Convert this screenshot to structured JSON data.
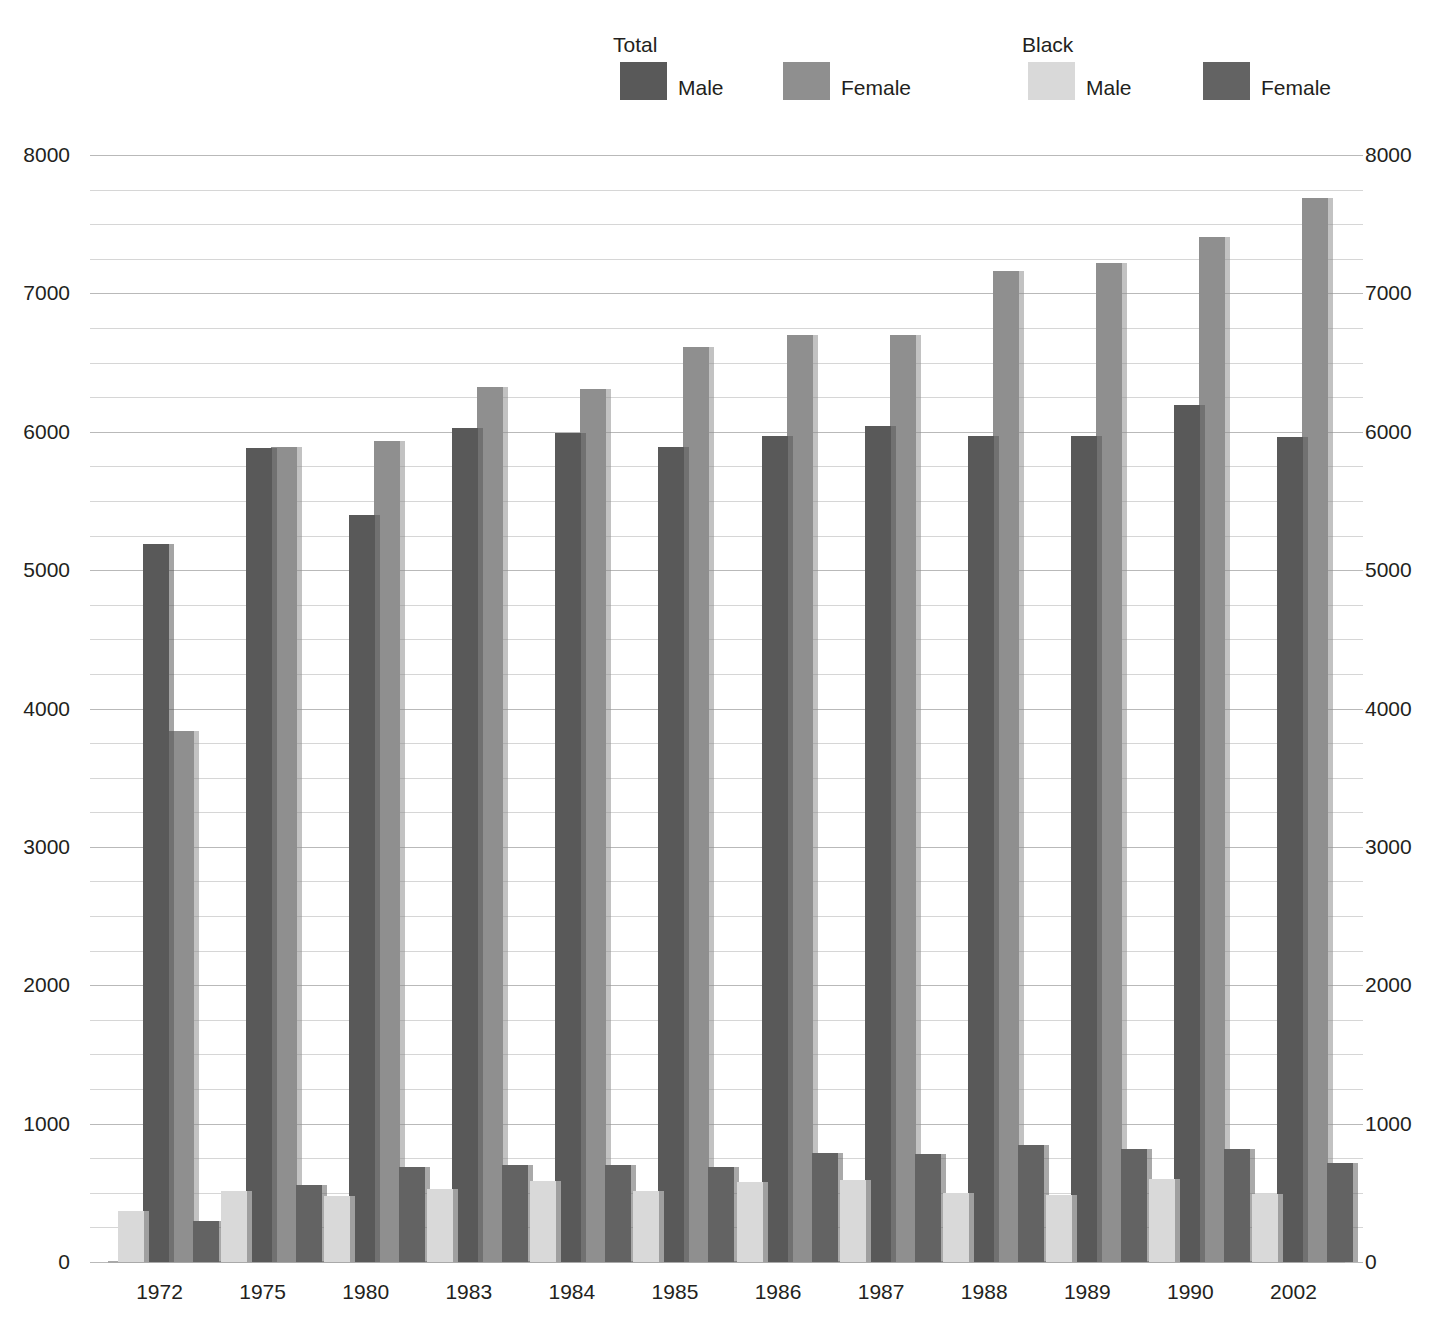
{
  "legend": {
    "groups": [
      {
        "title": "Total",
        "x": 613,
        "y": 33
      },
      {
        "title": "Black",
        "x": 1022,
        "y": 33
      }
    ],
    "entries": [
      {
        "label": "Male",
        "series": "total_male",
        "color": "#595959",
        "x": 620,
        "y": 62
      },
      {
        "label": "Female",
        "series": "total_female",
        "color": "#8f8f8f",
        "x": 783,
        "y": 62
      },
      {
        "label": "Male",
        "series": "black_male",
        "color": "#d9d9d9",
        "x": 1028,
        "y": 62
      },
      {
        "label": "Female",
        "series": "black_female",
        "color": "#636363",
        "x": 1203,
        "y": 62
      }
    ]
  },
  "axis": {
    "left_ticks": [
      "8000",
      "7000",
      "6000",
      "5000",
      "4000",
      "3000",
      "2000",
      "1000",
      "0"
    ],
    "right_ticks": [
      "8000",
      "7000",
      "6000",
      "5000",
      "4000",
      "3000",
      "2000",
      "1000",
      "0"
    ]
  },
  "chart_data": {
    "type": "bar",
    "title": "",
    "subtitle": "",
    "xlabel": "",
    "ylabel": "",
    "ylim": [
      0,
      8000
    ],
    "ytick_step": 1000,
    "yminor_step": 250,
    "grid": true,
    "legend_position": "top",
    "categories": [
      "1972",
      "1975",
      "1980",
      "1983",
      "1984",
      "1985",
      "1986",
      "1987",
      "1988",
      "1989",
      "1990",
      "2002"
    ],
    "series": [
      {
        "name": "Black Male",
        "key": "black_male",
        "color": "#d9d9d9",
        "values": [
          370,
          510,
          475,
          530,
          585,
          510,
          580,
          595,
          500,
          485,
          600,
          495
        ]
      },
      {
        "name": "Total Male",
        "key": "total_male",
        "color": "#595959",
        "values": [
          5190,
          5880,
          5400,
          6030,
          5990,
          5890,
          5970,
          6040,
          5970,
          5970,
          6190,
          5960
        ]
      },
      {
        "name": "Total Female",
        "key": "total_female",
        "color": "#8f8f8f",
        "values": [
          3840,
          5890,
          5930,
          6320,
          6310,
          6610,
          6700,
          6700,
          7160,
          7220,
          7410,
          7690
        ]
      },
      {
        "name": "Black Female",
        "key": "black_female",
        "color": "#636363",
        "values": [
          300,
          560,
          685,
          700,
          700,
          690,
          790,
          780,
          845,
          820,
          815,
          715
        ]
      }
    ]
  }
}
